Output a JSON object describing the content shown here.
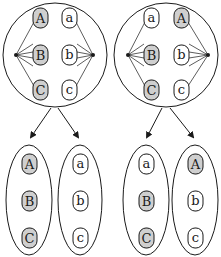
{
  "colors": {
    "stroke": "#1a1a1a",
    "filled_node": "#cfcfcf",
    "empty_node": "#ffffff",
    "background": "#ffffff"
  },
  "diagram": {
    "top_groups": [
      {
        "id": "left-circle",
        "left_column": [
          {
            "label": "A",
            "filled": true
          },
          {
            "label": "B",
            "filled": true
          },
          {
            "label": "C",
            "filled": true
          }
        ],
        "right_column": [
          {
            "label": "a",
            "filled": false
          },
          {
            "label": "b",
            "filled": false
          },
          {
            "label": "c",
            "filled": false
          }
        ]
      },
      {
        "id": "right-circle",
        "left_column": [
          {
            "label": "a",
            "filled": false
          },
          {
            "label": "B",
            "filled": true
          },
          {
            "label": "C",
            "filled": true
          }
        ],
        "right_column": [
          {
            "label": "A",
            "filled": true
          },
          {
            "label": "b",
            "filled": false
          },
          {
            "label": "c",
            "filled": false
          }
        ]
      }
    ],
    "bottom_groups": [
      {
        "id": "left-pair-left",
        "nodes": [
          {
            "label": "A",
            "filled": true
          },
          {
            "label": "B",
            "filled": true
          },
          {
            "label": "C",
            "filled": true
          }
        ]
      },
      {
        "id": "left-pair-right",
        "nodes": [
          {
            "label": "a",
            "filled": false
          },
          {
            "label": "b",
            "filled": false
          },
          {
            "label": "c",
            "filled": false
          }
        ]
      },
      {
        "id": "right-pair-left",
        "nodes": [
          {
            "label": "a",
            "filled": false
          },
          {
            "label": "B",
            "filled": true
          },
          {
            "label": "C",
            "filled": true
          }
        ]
      },
      {
        "id": "right-pair-right",
        "nodes": [
          {
            "label": "A",
            "filled": true
          },
          {
            "label": "b",
            "filled": false
          },
          {
            "label": "c",
            "filled": false
          }
        ]
      }
    ]
  }
}
